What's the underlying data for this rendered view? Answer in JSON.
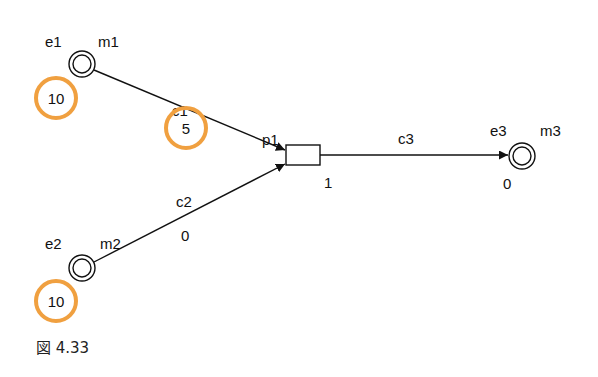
{
  "figure": {
    "caption": "図 4.33",
    "colors": {
      "stroke": "#111111",
      "highlight": "#f0a040",
      "background": "#ffffff"
    }
  },
  "places": [
    {
      "id": "m1",
      "event_label": "e1",
      "name_label": "m1",
      "tokens": "10",
      "tokens_highlighted": true
    },
    {
      "id": "m2",
      "event_label": "e2",
      "name_label": "m2",
      "tokens": "10",
      "tokens_highlighted": true
    },
    {
      "id": "m3",
      "event_label": "e3",
      "name_label": "m3",
      "tokens": "0",
      "tokens_highlighted": false
    }
  ],
  "transitions": [
    {
      "id": "p1",
      "label": "p1",
      "value": "1"
    }
  ],
  "arcs": [
    {
      "id": "c1",
      "label": "c1",
      "value": "5",
      "value_highlighted": true,
      "from": "m1",
      "to": "p1"
    },
    {
      "id": "c2",
      "label": "c2",
      "value": "0",
      "value_highlighted": false,
      "from": "m2",
      "to": "p1"
    },
    {
      "id": "c3",
      "label": "c3",
      "value": "",
      "value_highlighted": false,
      "from": "p1",
      "to": "m3"
    }
  ]
}
